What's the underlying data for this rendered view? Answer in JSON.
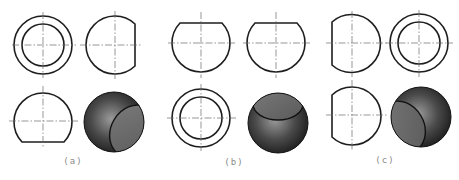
{
  "figure": {
    "panels": [
      {
        "id": "a",
        "label": "(a)",
        "views": [
          "top: concentric circles",
          "side: sphere cut on right",
          "front: sphere cut at bottom",
          "shaded 3D: cut face lower-right"
        ]
      },
      {
        "id": "b",
        "label": "(b)",
        "views": [
          "front: sphere cut at top",
          "side: sphere cut at top",
          "top: concentric circles",
          "shaded 3D: cut face on top"
        ]
      },
      {
        "id": "c",
        "label": "(c)",
        "views": [
          "front: sphere cut on left",
          "side: concentric circles",
          "top: sphere cut on left",
          "shaded 3D: cut face lower-left"
        ]
      }
    ],
    "colors": {
      "outline": "#1e1e1e",
      "centerline": "#6a6a6a",
      "sphere_dark": "#2a2a2a",
      "sphere_light": "#8c8c8c",
      "cut_face": "#6e6e6e",
      "label": "#8a8a8a"
    }
  }
}
